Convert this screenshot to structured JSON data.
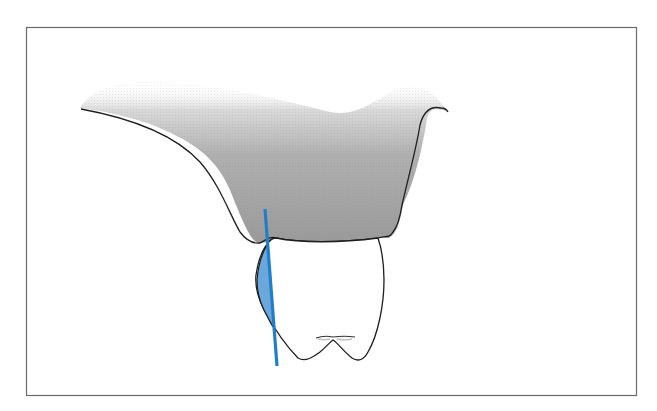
{
  "figure": {
    "type": "dental-illustration",
    "frame": {
      "x": 26,
      "y": 27,
      "width": 610,
      "height": 368,
      "stroke": "#6a6a6a"
    },
    "colors": {
      "background": "#ffffff",
      "tissue_fill_dark": "#9a9a9a",
      "tissue_fill_light": "#ffffff",
      "outline": "#1e1e1e",
      "reference_line": "#1f7fc8",
      "highlight_fill": "#5a9fd8"
    },
    "elements": [
      {
        "name": "gingiva-tissue",
        "fill": "gray gradient"
      },
      {
        "name": "tooth-crown",
        "fill": "white"
      },
      {
        "name": "blue-reference-line",
        "from": [
          265,
          209
        ],
        "to": [
          277,
          366
        ]
      },
      {
        "name": "blue-highlight-area"
      }
    ]
  }
}
